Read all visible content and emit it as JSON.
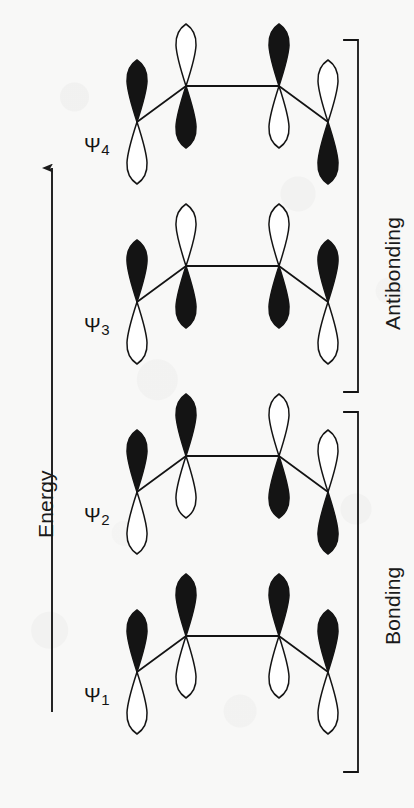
{
  "figure": {
    "kind": "molecular-orbital-energy-diagram",
    "molecule": "1,3-butadiene pi system",
    "background_color": "#f8f8f7",
    "ink_color": "#141414"
  },
  "energy_axis": {
    "label": "Energy",
    "arrow_direction": "up",
    "arrow_name": "energy-arrow"
  },
  "brackets": [
    {
      "id": "antibonding",
      "label": "Antibonding",
      "covers": [
        "psi3",
        "psi4"
      ],
      "top": 40,
      "bottom": 392
    },
    {
      "id": "bonding",
      "label": "Bonding",
      "covers": [
        "psi1",
        "psi2"
      ],
      "top": 412,
      "bottom": 772
    }
  ],
  "orbitals": [
    {
      "id": "psi1",
      "label": "Ψ",
      "subscript": "1",
      "nodes": 0,
      "classification": "Bonding",
      "center_y": 672,
      "label_x": 84,
      "label_y": 684,
      "lobes": [
        "filled",
        "filled",
        "filled",
        "filled"
      ]
    },
    {
      "id": "psi2",
      "label": "Ψ",
      "subscript": "2",
      "nodes": 1,
      "classification": "Bonding",
      "center_y": 492,
      "label_x": 84,
      "label_y": 504,
      "lobes": [
        "filled",
        "filled",
        "empty",
        "empty"
      ]
    },
    {
      "id": "psi3",
      "label": "Ψ",
      "subscript": "3",
      "nodes": 2,
      "classification": "Antibonding",
      "center_y": 302,
      "label_x": 84,
      "label_y": 314,
      "lobes": [
        "filled",
        "empty",
        "empty",
        "filled"
      ]
    },
    {
      "id": "psi4",
      "label": "Ψ",
      "subscript": "4",
      "nodes": 3,
      "classification": "Antibonding",
      "center_y": 122,
      "label_x": 84,
      "label_y": 134,
      "lobes": [
        "filled",
        "empty",
        "filled",
        "empty"
      ]
    }
  ],
  "chain_geometry": {
    "atom_x": [
      137,
      186,
      279,
      328
    ],
    "inner_rise": 36,
    "lobe_height": 62,
    "lobe_width": 30
  }
}
